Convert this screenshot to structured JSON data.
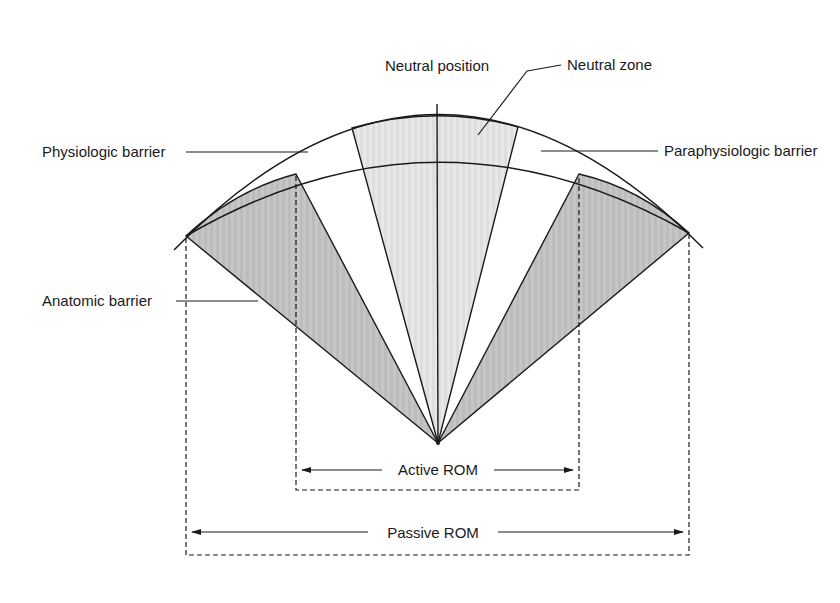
{
  "figure": {
    "top_cutoff_text": "",
    "labels": {
      "neutral_position": "Neutral position",
      "neutral_zone": "Neutral zone",
      "physiologic_barrier": "Physiologic barrier",
      "paraphysiologic_barrier": "Paraphysiologic barrier",
      "anatomic_barrier": "Anatomic barrier",
      "active_rom": "Active ROM",
      "passive_rom": "Passive ROM"
    },
    "colors": {
      "line": "#1a1a1a",
      "wedge_dark": "#c4c4c4",
      "wedge_light": "#e6e6e6",
      "background": "#ffffff"
    }
  }
}
